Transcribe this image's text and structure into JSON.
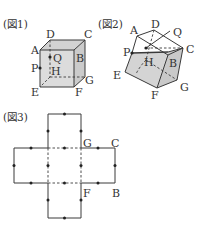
{
  "figures": [
    {
      "title": "(図1)",
      "type": "cube",
      "vertices": {
        "A": "A",
        "B": "B",
        "C": "C",
        "D": "D",
        "E": "E",
        "F": "F",
        "G": "G",
        "H": "H"
      },
      "points": {
        "P": "P",
        "Q": "Q"
      }
    },
    {
      "title": "(図2)",
      "type": "cube-tilted",
      "vertices": {
        "A": "A",
        "B": "B",
        "C": "C",
        "D": "D",
        "E": "E",
        "F": "F",
        "G": "G",
        "H": "H"
      },
      "points": {
        "P": "P",
        "Q": "Q"
      }
    },
    {
      "title": "(図3)",
      "type": "cube-net",
      "labels": {
        "G": "G",
        "C": "C",
        "F": "F",
        "B": "B"
      }
    }
  ],
  "colors": {
    "line": "#3a3a3a",
    "face_fill": "#d9d9d9",
    "face_fill_dark": "#c8c8c8",
    "text": "#333333"
  }
}
